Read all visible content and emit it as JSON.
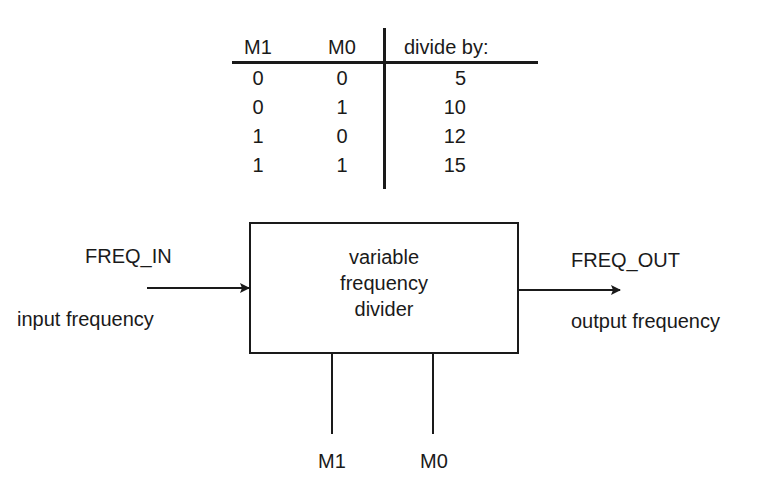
{
  "truth_table": {
    "headers": [
      "M1",
      "M0",
      "divide by:"
    ],
    "rows": [
      {
        "M1": "0",
        "M0": "0",
        "divide_by": "5"
      },
      {
        "M1": "0",
        "M0": "1",
        "divide_by": "10"
      },
      {
        "M1": "1",
        "M0": "0",
        "divide_by": "12"
      },
      {
        "M1": "1",
        "M0": "1",
        "divide_by": "15"
      }
    ]
  },
  "diagram": {
    "block": {
      "lines": [
        "variable",
        "frequency",
        "divider"
      ]
    },
    "input": {
      "signal": "FREQ_IN",
      "description": "input frequency"
    },
    "output": {
      "signal": "FREQ_OUT",
      "description": "output frequency"
    },
    "controls": [
      "M1",
      "M0"
    ]
  },
  "colors": {
    "ink": "#1a1a1a",
    "background": "#ffffff"
  }
}
